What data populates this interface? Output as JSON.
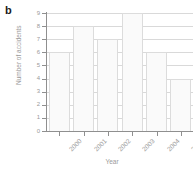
{
  "panel": {
    "label": "b"
  },
  "chart_data": {
    "type": "bar",
    "title": "",
    "categories": [
      "2000",
      "2001",
      "2002",
      "2003",
      "2004",
      "2005"
    ],
    "values": [
      6,
      8,
      7,
      9,
      6,
      4
    ],
    "xlabel": "Year",
    "ylabel": "Number of accidents",
    "ylim": [
      0,
      9
    ],
    "yticks": [
      0,
      1,
      2,
      3,
      4,
      5,
      6,
      7,
      8,
      9
    ],
    "ytick_labels": [
      "0",
      "1",
      "2",
      "3",
      "4",
      "5",
      "6",
      "7",
      "8",
      "9"
    ],
    "grid": true,
    "grid_axis": "y",
    "legend": false,
    "xtick_rotation": -45,
    "bar_fill_color": "#fafafa",
    "bar_edge_color": "#dcdcdc",
    "grid_color": "#d9d9d9",
    "axis_color": "#8f8f8f",
    "text_color": "#9a9a9a"
  }
}
